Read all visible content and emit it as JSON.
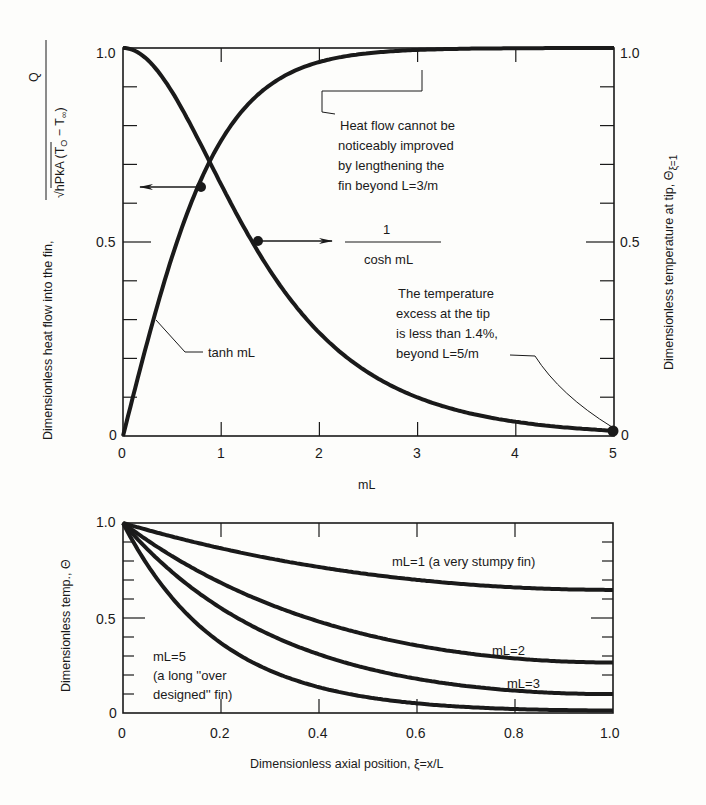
{
  "chart_data": [
    {
      "type": "line",
      "title": "",
      "xlabel": "mL",
      "ylabel_left": "Dimensionless heat flow into the fin, Q / (√(hPkA) (T0 − T∞))",
      "ylabel_right": "Dimensionless temperature at tip, Θξ=1",
      "xlim": [
        0,
        5
      ],
      "ylim": [
        0,
        1.0
      ],
      "x_ticks": [
        "0",
        "1",
        "2",
        "3",
        "4",
        "5"
      ],
      "y_ticks_left": [
        "0",
        "0.5",
        "1.0"
      ],
      "y_ticks_right": [
        "0",
        "0.5",
        "1.0"
      ],
      "grid": false,
      "series": [
        {
          "name": "tanh mL",
          "axis": "left",
          "x": [
            0,
            0.25,
            0.5,
            0.75,
            1.0,
            1.5,
            2.0,
            2.5,
            3.0,
            4.0,
            5.0
          ],
          "y": [
            0,
            0.245,
            0.462,
            0.635,
            0.762,
            0.905,
            0.964,
            0.987,
            0.995,
            0.999,
            1.0
          ]
        },
        {
          "name": "1 / cosh mL",
          "axis": "right",
          "x": [
            0,
            0.25,
            0.5,
            0.75,
            1.0,
            1.5,
            2.0,
            2.5,
            3.0,
            4.0,
            5.0
          ],
          "y": [
            1.0,
            0.97,
            0.887,
            0.773,
            0.648,
            0.425,
            0.266,
            0.163,
            0.099,
            0.037,
            0.013
          ]
        }
      ],
      "markers": [
        {
          "x": 0.8,
          "y": 0.66,
          "arrow": "left"
        },
        {
          "x": 1.4,
          "y": 0.5,
          "arrow": "right"
        },
        {
          "x": 5.0,
          "y": 0.013
        }
      ],
      "annotations": [
        {
          "text_lines": [
            "Heat flow cannot be",
            "noticeably improved",
            "by lengthening the",
            "fin beyond L=3/m"
          ]
        },
        {
          "text_lines": [
            "The temperature",
            "excess at the tip",
            "is less than 1.4%,",
            "beyond L=5/m"
          ]
        },
        {
          "text": "tanh mL"
        },
        {
          "text_num": "1",
          "text_den": "cosh mL"
        }
      ]
    },
    {
      "type": "line",
      "title": "",
      "xlabel": "Dimensionless axial position, ξ=x/L",
      "ylabel": "Dimensionless temp., Θ",
      "xlim": [
        0,
        1.0
      ],
      "ylim": [
        0,
        1.0
      ],
      "x_ticks": [
        "0",
        "0.2",
        "0.4",
        "0.6",
        "0.8",
        "1.0"
      ],
      "y_ticks": [
        "0",
        "0.5",
        "1.0"
      ],
      "grid": false,
      "series": [
        {
          "name": "mL=1 (a very stumpy fin)",
          "mL": 1,
          "x": [
            0,
            0.2,
            0.4,
            0.6,
            0.8,
            1.0
          ],
          "y": [
            1.0,
            0.838,
            0.73,
            0.665,
            0.654,
            0.648
          ]
        },
        {
          "name": "mL=2",
          "mL": 2,
          "x": [
            0,
            0.2,
            0.4,
            0.6,
            0.8,
            1.0
          ],
          "y": [
            1.0,
            0.681,
            0.476,
            0.355,
            0.288,
            0.266
          ]
        },
        {
          "name": "mL=3",
          "mL": 3,
          "x": [
            0,
            0.2,
            0.4,
            0.6,
            0.8,
            1.0
          ],
          "y": [
            1.0,
            0.551,
            0.306,
            0.175,
            0.114,
            0.099
          ]
        },
        {
          "name": "mL=5 (a long \"over designed\" fin)",
          "mL": 5,
          "x": [
            0,
            0.2,
            0.4,
            0.6,
            0.8,
            1.0
          ],
          "y": [
            1.0,
            0.368,
            0.135,
            0.05,
            0.019,
            0.013
          ]
        }
      ]
    }
  ],
  "top": {
    "xlabel": "mL",
    "ylabel_left_main": "Dimensionless heat flow into the fin,",
    "ylabel_left_num": "Q",
    "ylabel_left_den": "√hPkA  (T",
    "ylabel_left_den_sub0": "O",
    "ylabel_left_den_mid": " − T",
    "ylabel_left_den_sub1": "∞",
    "ylabel_left_den_end": ")",
    "ylabel_right": "Dimensionless temperature at tip, Θ",
    "ylabel_right_sub": "ξ=1",
    "xticks": [
      "0",
      "1",
      "2",
      "3",
      "4",
      "5"
    ],
    "ytick_left": {
      "top": "1.0",
      "mid": "0.5",
      "bot": "0"
    },
    "ytick_right": {
      "top": "1.0",
      "mid": "0.5",
      "bot": "0"
    },
    "ann_heat": [
      "Heat flow cannot be",
      "noticeably improved",
      "by lengthening the",
      "fin beyond L=3/m"
    ],
    "ann_tip": [
      "The temperature",
      "excess at the tip",
      "is less than 1.4%,",
      "beyond L=5/m"
    ],
    "tanh_label": "tanh mL",
    "cosh_num": "1",
    "cosh_den": "cosh mL"
  },
  "bottom": {
    "xlabel": "Dimensionless axial position, ξ=x/L",
    "ylabel": "Dimensionless temp., Θ",
    "xticks": [
      "0",
      "0.2",
      "0.4",
      "0.6",
      "0.8",
      "1.0"
    ],
    "ytick": {
      "top": "1.0",
      "mid": "0.5",
      "bot": "0"
    },
    "lbl_ml1": "mL=1 (a very stumpy fin)",
    "lbl_ml2": "mL=2",
    "lbl_ml3": "mL=3",
    "lbl_ml5": [
      "mL=5",
      "(a long ''over",
      "designed'' fin)"
    ]
  }
}
